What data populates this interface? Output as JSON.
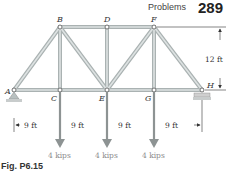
{
  "header": {
    "section": "Problems",
    "page_number": "289"
  },
  "caption": "Fig. P6.15",
  "nodes": {
    "A": "A",
    "B": "B",
    "C": "C",
    "D": "D",
    "E": "E",
    "F": "F",
    "G": "G",
    "H": "H"
  },
  "dimensions": {
    "height": "12 ft",
    "spans": [
      "9 ft",
      "9 ft",
      "9 ft",
      "9 ft"
    ]
  },
  "loads": [
    {
      "node": "C",
      "label": "4 kips"
    },
    {
      "node": "E",
      "label": "4 kips"
    },
    {
      "node": "G",
      "label": "4 kips"
    }
  ],
  "colors": {
    "member": "#c9cfcf",
    "member_edge": "#9aa3a3",
    "load_arrow": "#8d9393",
    "text": "#333333"
  }
}
